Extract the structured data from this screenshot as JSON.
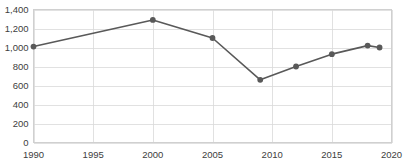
{
  "chart_data": {
    "type": "line",
    "title": "",
    "subtitle": "",
    "xlabel": "",
    "ylabel": "",
    "xlim": [
      1990,
      2020
    ],
    "ylim": [
      0,
      1400
    ],
    "grid": "horizontal-and-vertical",
    "legend": "none",
    "series_color": "#595959",
    "marker_color": "#595959",
    "x": [
      1990,
      2000,
      2005,
      2009,
      2012,
      2015,
      2018,
      2019
    ],
    "values": [
      1010,
      1290,
      1100,
      660,
      800,
      930,
      1020,
      1000
    ],
    "points": [
      {
        "x": 1990,
        "y": 1010
      },
      {
        "x": 2000,
        "y": 1290
      },
      {
        "x": 2005,
        "y": 1100
      },
      {
        "x": 2009,
        "y": 660
      },
      {
        "x": 2012,
        "y": 800
      },
      {
        "x": 2015,
        "y": 930
      },
      {
        "x": 2018,
        "y": 1020
      },
      {
        "x": 2019,
        "y": 1000
      }
    ],
    "y_ticks": [
      0,
      200,
      400,
      600,
      800,
      1000,
      1200,
      1400
    ],
    "y_tick_labels": [
      "0",
      "200",
      "400",
      "600",
      "800",
      "1,000",
      "1,200",
      "1,400"
    ],
    "x_ticks": [
      1990,
      1995,
      2000,
      2005,
      2010,
      2015,
      2020
    ],
    "x_tick_labels": [
      "1990",
      "1995",
      "2000",
      "2005",
      "2010",
      "2015",
      "2020"
    ]
  },
  "axis_colors": {
    "gridline": "#d9d9d9",
    "frame": "#d0d0d0",
    "tick_text": "#404040"
  }
}
